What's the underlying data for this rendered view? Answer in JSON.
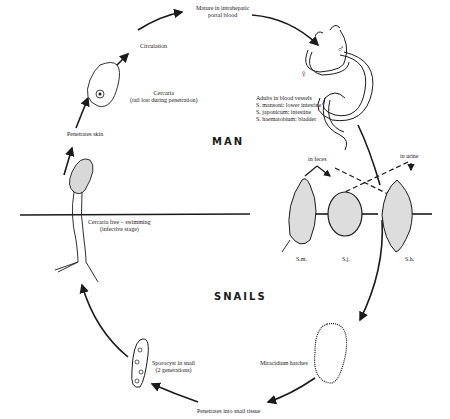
{
  "diagram": {
    "type": "life-cycle",
    "zones": {
      "upper": "MAN",
      "lower": "SNAILS"
    },
    "stages": {
      "mature": {
        "line1": "Mature in intrahepatic",
        "line2": "portal blood"
      },
      "circulation": "Circulation",
      "cercaria": {
        "line1": "Cercaria",
        "line2": "(tail lost during penetration)"
      },
      "penetrates_skin": "Penetrates skin",
      "adults": {
        "line1": "Adults in blood vessels",
        "line2": "S. mansoni: lower intestine",
        "line3": "S. japonicum: intestine",
        "line4": "S. haematobium: bladder"
      },
      "in_feces": "in feces",
      "in_urine": "in urine",
      "eggs": {
        "sm": "S.m.",
        "sj": "S.j.",
        "sh": "S.h."
      },
      "cercaria_free": {
        "line1": "Cercaria free – swimming",
        "line2": "(infective stage)"
      },
      "miracidium": "Miracidium hatches",
      "sporocyst": {
        "line1": "Sporocyst in snail",
        "line2": "(2 generations)"
      },
      "penetrates_snail": "Penetrates into snail tissue"
    },
    "symbols": {
      "female": "♀",
      "male": "♂"
    },
    "colors": {
      "ink": "#1a1a1a",
      "background": "#ffffff"
    }
  }
}
